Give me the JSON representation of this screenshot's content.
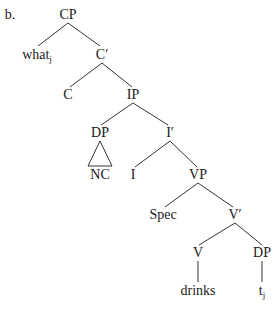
{
  "example_label": "b.",
  "nodes": {
    "cp": "CP",
    "what": "what",
    "what_index": "j",
    "c_bar": "C′",
    "c": "C",
    "ip": "IP",
    "dp_subject": "DP",
    "nc": "NC",
    "i_bar": "I′",
    "i": "I",
    "vp": "VP",
    "spec": "Spec",
    "v_bar": "V′",
    "v": "V",
    "dp_object": "DP",
    "drinks": "drinks",
    "trace": "t",
    "trace_index": "j"
  }
}
